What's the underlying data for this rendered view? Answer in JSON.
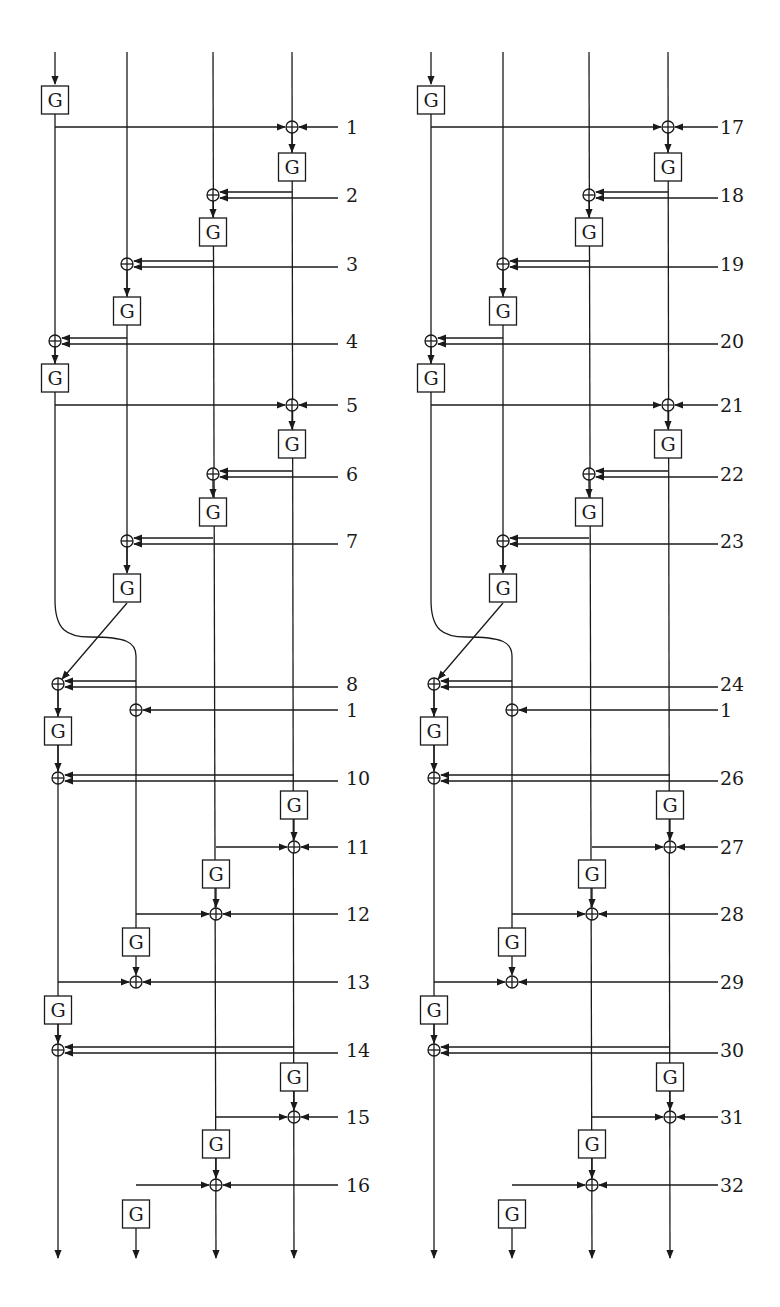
{
  "figure": {
    "g_label": "G",
    "colors": {
      "ink": "#1a1a1a",
      "background": "#ffffff"
    }
  },
  "diagrams": [
    {
      "id": "left",
      "x_offset": 0,
      "round_labels": [
        "1",
        "2",
        "3",
        "4",
        "5",
        "6",
        "7",
        "8",
        "1",
        "10",
        "11",
        "12",
        "13",
        "14",
        "15",
        "16"
      ]
    },
    {
      "id": "right",
      "x_offset": 376,
      "round_labels": [
        "17",
        "18",
        "19",
        "20",
        "21",
        "22",
        "23",
        "24",
        "1",
        "26",
        "27",
        "28",
        "29",
        "30",
        "31",
        "32"
      ]
    }
  ],
  "geometry": {
    "upper_cols": [
      55,
      127,
      213,
      292
    ],
    "lower_cols": [
      58,
      136,
      216,
      294
    ],
    "top_y": 52,
    "bottom_y": 1258,
    "label_line_end": 338,
    "label_x": 346,
    "g_w": 27,
    "g_h": 28,
    "xor_r": 6,
    "rows": [
      {
        "type": "single",
        "from_col": 0,
        "to_col": 3,
        "y": 127,
        "g_before": {
          "col": 0,
          "y": 86
        },
        "g_after": {
          "col": 3,
          "y": 153
        }
      },
      {
        "type": "double",
        "from_col": 3,
        "to_col": 2,
        "y": 195,
        "g_after": {
          "col": 2,
          "y": 218
        }
      },
      {
        "type": "double",
        "from_col": 2,
        "to_col": 1,
        "y": 264,
        "g_after": {
          "col": 1,
          "y": 297
        }
      },
      {
        "type": "double",
        "from_col": 1,
        "to_col": 0,
        "y": 341,
        "g_after": {
          "col": 0,
          "y": 364
        }
      },
      {
        "type": "single",
        "from_col": 0,
        "to_col": 3,
        "y": 405,
        "g_after": {
          "col": 3,
          "y": 430
        }
      },
      {
        "type": "double",
        "from_col": 3,
        "to_col": 2,
        "y": 474,
        "g_after": {
          "col": 2,
          "y": 498
        }
      },
      {
        "type": "double",
        "from_col": 2,
        "to_col": 1,
        "y": 541,
        "g_after": {
          "col": 1,
          "y": 574
        }
      },
      {
        "type": "double",
        "from_col": 1,
        "to_col": 0,
        "y": 684,
        "lower": true,
        "g_after": {
          "col": 0,
          "y": 717
        }
      },
      {
        "type": "key_only",
        "to_col": 1,
        "y": 710,
        "lower": true
      },
      {
        "type": "double",
        "from_col": 3,
        "to_col": 0,
        "y": 778,
        "lower": true,
        "g_after": {
          "col": 3,
          "y": 791
        }
      },
      {
        "type": "single",
        "from_col": 2,
        "to_col": 3,
        "y": 847,
        "lower": true,
        "g_after": {
          "col": 2,
          "y": 860
        }
      },
      {
        "type": "single",
        "from_col": 1,
        "to_col": 2,
        "y": 914,
        "lower": true,
        "g_after": {
          "col": 1,
          "y": 928
        }
      },
      {
        "type": "single",
        "from_col": 0,
        "to_col": 1,
        "y": 982,
        "lower": true,
        "g_after": {
          "col": 0,
          "y": 996
        }
      },
      {
        "type": "double",
        "from_col": 3,
        "to_col": 0,
        "y": 1050,
        "lower": true,
        "g_after": {
          "col": 3,
          "y": 1063
        }
      },
      {
        "type": "single",
        "from_col": 2,
        "to_col": 3,
        "y": 1117,
        "lower": true,
        "g_after": {
          "col": 2,
          "y": 1130
        }
      },
      {
        "type": "single",
        "from_col": 1,
        "to_col": 2,
        "y": 1185,
        "lower": true,
        "g_after": {
          "col": 1,
          "y": 1200
        }
      }
    ]
  }
}
